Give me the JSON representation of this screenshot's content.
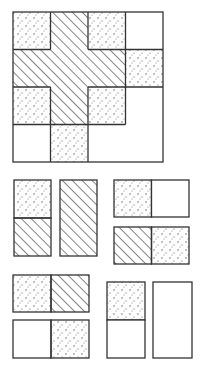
{
  "colors": {
    "background": "#ffffff",
    "stroke": "#333333",
    "hatch": "#333333",
    "dot": "#555555"
  },
  "legend_fills": [
    "dotted",
    "hatched",
    "blank"
  ],
  "board": {
    "x": 13,
    "y": 12,
    "cell": 37.5,
    "rows": 4,
    "cols": 4,
    "cells": [
      [
        "dotted",
        "hatched",
        "dotted",
        "blank"
      ],
      [
        "hatched",
        "hatched",
        "hatched",
        "dotted"
      ],
      [
        "dotted",
        "hatched",
        "dotted",
        "blankL"
      ],
      [
        "blank",
        "dotted",
        "blankL",
        "blankL"
      ]
    ],
    "regions": [
      {
        "name": "hatched-cross",
        "fill": "hatched",
        "cells": [
          [
            0,
            1
          ],
          [
            1,
            0
          ],
          [
            1,
            1
          ],
          [
            1,
            2
          ],
          [
            2,
            1
          ]
        ]
      },
      {
        "name": "blank-L",
        "fill": "blank",
        "cells": [
          [
            2,
            3
          ],
          [
            3,
            2
          ],
          [
            3,
            3
          ]
        ]
      }
    ]
  },
  "pieces": [
    {
      "name": "piece-vertical-dotted-hatched",
      "x": 14,
      "y": 180,
      "w": 37,
      "h": 76,
      "orient": "vertical",
      "halves": [
        "dotted",
        "hatched"
      ]
    },
    {
      "name": "piece-vertical-hatched-hatched",
      "x": 60,
      "y": 180,
      "w": 37,
      "h": 76,
      "orient": "vertical",
      "halves": [
        "hatched",
        "hatched"
      ],
      "merged": true
    },
    {
      "name": "piece-horizontal-dotted-blank",
      "x": 114,
      "y": 180,
      "w": 75,
      "h": 37,
      "orient": "horizontal",
      "halves": [
        "dotted",
        "blank"
      ]
    },
    {
      "name": "piece-horizontal-hatched-dotted",
      "x": 114,
      "y": 227,
      "w": 75,
      "h": 37,
      "orient": "horizontal",
      "halves": [
        "hatched",
        "dotted"
      ]
    },
    {
      "name": "piece-horizontal-dotted-hatched",
      "x": 13,
      "y": 275,
      "w": 76,
      "h": 37,
      "orient": "horizontal",
      "halves": [
        "dotted",
        "hatched"
      ]
    },
    {
      "name": "piece-horizontal-blank-dotted",
      "x": 13,
      "y": 320,
      "w": 76,
      "h": 38,
      "orient": "horizontal",
      "halves": [
        "blank",
        "dotted"
      ]
    },
    {
      "name": "piece-vertical-dotted-blank",
      "x": 107,
      "y": 282,
      "w": 38,
      "h": 76,
      "orient": "vertical",
      "halves": [
        "dotted",
        "blank"
      ]
    },
    {
      "name": "piece-vertical-blank-blank",
      "x": 153,
      "y": 282,
      "w": 39,
      "h": 76,
      "orient": "vertical",
      "halves": [
        "blank",
        "blank"
      ],
      "merged": true
    }
  ]
}
